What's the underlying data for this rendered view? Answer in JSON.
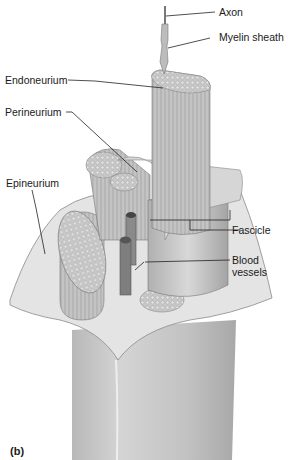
{
  "figure": {
    "panel_label": "(b)",
    "labels": {
      "axon": "Axon",
      "myelin_sheath": "Myelin sheath",
      "endoneurium": "Endoneurium",
      "perineurium": "Perineurium",
      "epineurium": "Epineurium",
      "fascicle": "Fascicle",
      "blood_vessels_line1": "Blood",
      "blood_vessels_line2": "vessels"
    }
  }
}
